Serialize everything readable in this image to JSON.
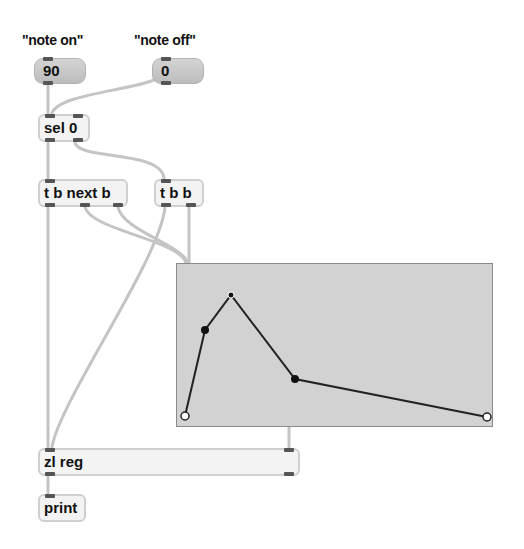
{
  "comments": {
    "note_on": "\"note on\"",
    "note_off": "\"note off\""
  },
  "messages": {
    "m90": "90",
    "m0": "0"
  },
  "objects": {
    "sel": "sel 0",
    "tb_next": "t b next b",
    "tbb": "t b b",
    "zlreg": "zl reg",
    "print": "print"
  },
  "breakpoint_editor": {
    "background": "#d2d2d2",
    "points": [
      {
        "x": 184,
        "y": 415,
        "style": "hollow"
      },
      {
        "x": 204,
        "y": 329,
        "style": "filled"
      },
      {
        "x": 230,
        "y": 294,
        "style": "small"
      },
      {
        "x": 294,
        "y": 378,
        "style": "filled"
      },
      {
        "x": 486,
        "y": 416,
        "style": "hollow"
      }
    ]
  },
  "colors": {
    "cable": "#c4c4c4",
    "object_fill": "#f3f3f3",
    "message_fill": "#c8c8c8",
    "inlet": "#555555"
  }
}
